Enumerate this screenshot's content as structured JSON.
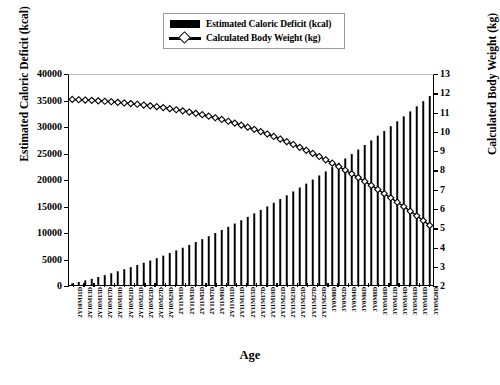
{
  "legend": {
    "items": [
      {
        "label": "Estimated Caloric Deficit (kcal)",
        "icon": "filled-bar-swatch",
        "color": "#000000"
      },
      {
        "label": "Calculated Body Weight (kg)",
        "icon": "line-diamond-marker",
        "color": "#000000"
      }
    ]
  },
  "axes": {
    "x_title": "Age",
    "y_left_title": "Estimated Caloric Deficit (kcal)",
    "y_right_title": "Calculated Body Weight (kg)"
  },
  "chart_data": {
    "type": "bar",
    "title": "",
    "subtitle": "",
    "xlabel": "Age",
    "ylabel": "Estimated Caloric Deficit (kcal)",
    "y2label": "Calculated Body Weight (kg)",
    "ylim": [
      0,
      40000
    ],
    "y2lim": [
      2,
      13
    ],
    "yticks": [
      0,
      5000,
      10000,
      15000,
      20000,
      25000,
      30000,
      35000,
      40000
    ],
    "y2ticks": [
      2,
      3,
      4,
      5,
      6,
      7,
      8,
      9,
      10,
      11,
      12,
      13
    ],
    "grid": false,
    "legend_position": "top-center",
    "categories": [
      "2Y10M11D",
      "2Y10M13D",
      "2Y10M15D",
      "2Y10M17D",
      "2Y10M19D",
      "2Y10M21D",
      "2Y10M23D",
      "2Y10M25D",
      "2Y10M27D",
      "2Y10M29D",
      "2Y11M1D",
      "2Y11M3D",
      "2Y11M5D",
      "2Y11M7D",
      "2Y11M9D",
      "2Y11M11D",
      "2Y11M13D",
      "2Y11M15D",
      "2Y11M17D",
      "2Y11M19D",
      "2Y11M21D",
      "2Y11M23D",
      "2Y11M25D",
      "2Y11M27D",
      "2Y11M29D",
      "3Y0M0D",
      "3Y0M2D",
      "3Y0M4D",
      "3Y0M6D",
      "3Y0M8D",
      "3Y0M10D",
      "3Y0M12D",
      "3Y0M14D",
      "3Y0M16D",
      "3Y0M18D",
      "3Y0M20D"
    ],
    "series": [
      {
        "name": "Estimated Caloric Deficit (kcal)",
        "type": "bar",
        "axis": "left",
        "color": "#000000",
        "values": [
          250,
          600,
          1000,
          1450,
          1900,
          2400,
          2900,
          3450,
          4000,
          4600,
          5250,
          5900,
          6600,
          7300,
          8050,
          8800,
          9600,
          10400,
          11250,
          12100,
          13000,
          13900,
          14850,
          15800,
          16800,
          17800,
          18850,
          19900,
          21000,
          22100,
          23250,
          24400,
          25600,
          26800,
          28050,
          29300
        ]
      },
      {
        "name": "Calculated Body Weight (kg)",
        "type": "line",
        "axis": "right",
        "color": "#000000",
        "marker": "diamond",
        "values": [
          11.72,
          11.7,
          11.68,
          11.65,
          11.62,
          11.58,
          11.54,
          11.49,
          11.44,
          11.38,
          11.31,
          11.24,
          11.16,
          11.07,
          10.97,
          10.86,
          10.74,
          10.61,
          10.47,
          10.32,
          10.16,
          9.99,
          9.81,
          9.62,
          9.42,
          9.21,
          8.99,
          8.76,
          8.52,
          8.27,
          8.01,
          7.74,
          7.46,
          7.17,
          6.87,
          6.56
        ]
      }
    ],
    "n_points": 56
  }
}
